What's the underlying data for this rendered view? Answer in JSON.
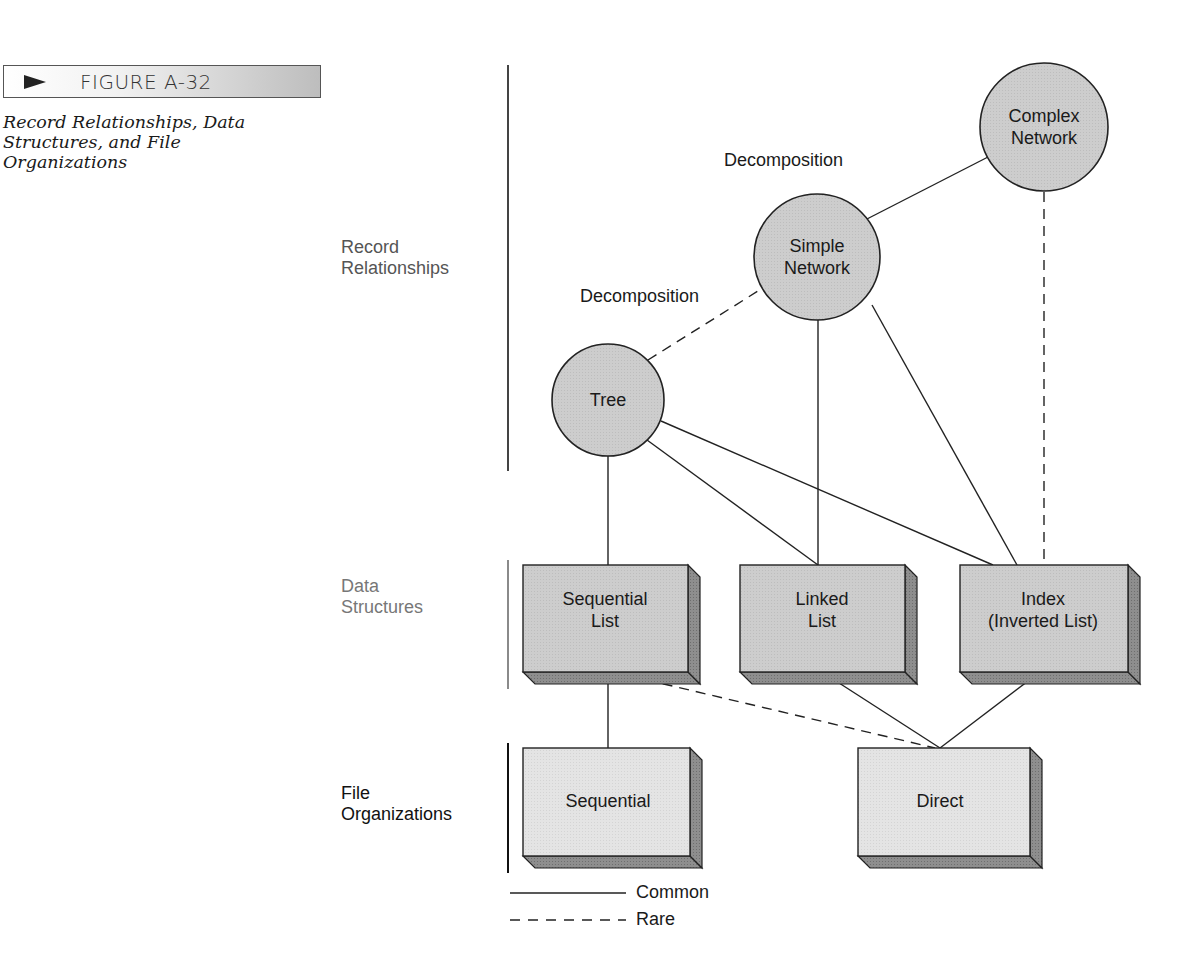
{
  "figure": {
    "label": "FIGURE A-32",
    "caption": "Record Relationships, Data Structures, and File Organizations",
    "arrow_icon": "arrowhead-right-icon"
  },
  "levels": {
    "record": "Record Relationships",
    "data": "Data Structures",
    "file": "File Organizations"
  },
  "nodes": {
    "complex_network": "Complex Network",
    "simple_network": "Simple Network",
    "tree": "Tree",
    "sequential_list": "Sequential List",
    "linked_list": "Linked List",
    "index": "Index (Inverted List)",
    "sequential": "Sequential",
    "direct": "Direct"
  },
  "node_lines": {
    "complex_network": [
      "Complex",
      "Network"
    ],
    "simple_network": [
      "Simple",
      "Network"
    ],
    "tree": [
      "Tree"
    ],
    "sequential_list": [
      "Sequential",
      "List"
    ],
    "linked_list": [
      "Linked",
      "List"
    ],
    "index": [
      "Index",
      "(Inverted List)"
    ],
    "sequential": [
      "Sequential"
    ],
    "direct": [
      "Direct"
    ]
  },
  "edge_labels": {
    "upper_decomposition": "Decomposition",
    "lower_decomposition": "Decomposition"
  },
  "edges": [
    {
      "from": "Simple Network",
      "to": "Complex Network",
      "style": "common"
    },
    {
      "from": "Tree",
      "to": "Simple Network",
      "style": "rare"
    },
    {
      "from": "Complex Network",
      "to": "Index (Inverted List)",
      "style": "rare"
    },
    {
      "from": "Simple Network",
      "to": "Linked List",
      "style": "common"
    },
    {
      "from": "Simple Network",
      "to": "Index (Inverted List)",
      "style": "common"
    },
    {
      "from": "Tree",
      "to": "Sequential List",
      "style": "common"
    },
    {
      "from": "Tree",
      "to": "Linked List",
      "style": "common"
    },
    {
      "from": "Tree",
      "to": "Index (Inverted List)",
      "style": "common"
    },
    {
      "from": "Sequential List",
      "to": "Sequential",
      "style": "common"
    },
    {
      "from": "Sequential List",
      "to": "Direct",
      "style": "rare"
    },
    {
      "from": "Linked List",
      "to": "Direct",
      "style": "common"
    },
    {
      "from": "Index (Inverted List)",
      "to": "Direct",
      "style": "common"
    }
  ],
  "legend": {
    "common": "Common",
    "rare": "Rare"
  },
  "colors": {
    "circle_fill": "#cfcfcf",
    "box_fill": "#d8d8d8",
    "file_box_fill": "#e6e6e6",
    "box_side": "#8c8c8c",
    "stroke": "#222222"
  }
}
